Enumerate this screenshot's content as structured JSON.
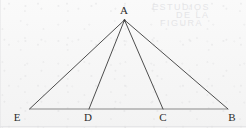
{
  "figure": {
    "canvas": {
      "width": 246,
      "height": 128
    },
    "background_color": "#f6f6f6",
    "line_color": "#3a3a3a",
    "baseline_color": "#8a8a8a",
    "label_color": "#2c2c2c",
    "points": [
      {
        "id": "A",
        "label": "A",
        "x": 124.5,
        "y": 20.0,
        "label_x": 124.0,
        "label_y": 10.0
      },
      {
        "id": "E",
        "label": "E",
        "x": 29.5,
        "y": 109.0,
        "label_x": 17.0,
        "label_y": 117.0
      },
      {
        "id": "D",
        "label": "D",
        "x": 89.0,
        "y": 109.0,
        "label_x": 88.0,
        "label_y": 117.0
      },
      {
        "id": "C",
        "label": "C",
        "x": 163.0,
        "y": 109.0,
        "label_x": 163.0,
        "label_y": 117.0
      },
      {
        "id": "B",
        "label": "B",
        "x": 228.0,
        "y": 109.0,
        "label_x": 232.0,
        "label_y": 117.0
      }
    ],
    "segments": [
      {
        "id": "AE",
        "from": "A",
        "to": "E",
        "role": "left-side",
        "color": "#3a3a3a",
        "width": 0.9
      },
      {
        "id": "AD",
        "from": "A",
        "to": "D",
        "role": "cevian",
        "color": "#3a3a3a",
        "width": 0.9
      },
      {
        "id": "AC",
        "from": "A",
        "to": "C",
        "role": "cevian",
        "color": "#3a3a3a",
        "width": 0.9
      },
      {
        "id": "AB",
        "from": "A",
        "to": "B",
        "role": "right-side",
        "color": "#3a3a3a",
        "width": 0.9
      },
      {
        "id": "EB",
        "from": "E",
        "to": "B",
        "role": "baseline",
        "color": "#8a8a8a",
        "width": 1.1
      }
    ],
    "ghost_marks": [
      {
        "text": "ESTUDIOS",
        "x": 152,
        "y": 2,
        "opacity": 0.45
      },
      {
        "text": "DE LA",
        "x": 176,
        "y": 10,
        "opacity": 0.38
      },
      {
        "text": "FIGURA",
        "x": 160,
        "y": 18,
        "opacity": 0.32
      }
    ]
  }
}
